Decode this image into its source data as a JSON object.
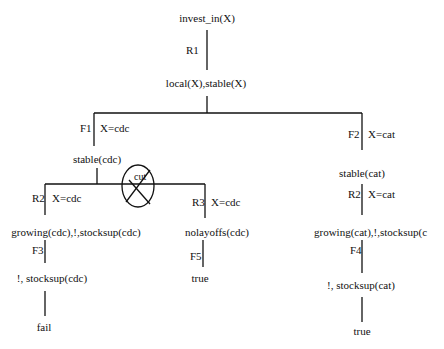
{
  "tree": {
    "root": "invest_in(X)",
    "edges": {
      "r1": {
        "rule": "R1",
        "binding": ""
      },
      "f1": {
        "rule": "F1",
        "binding": "X=cdc"
      },
      "f2": {
        "rule": "F2",
        "binding": "X=cat"
      },
      "r2_left": {
        "rule": "R2",
        "binding": "X=cdc"
      },
      "r3": {
        "rule": "R3",
        "binding": "X=cdc"
      },
      "r2_right": {
        "rule": "R2",
        "binding": "X=cat"
      },
      "f3": {
        "rule": "F3",
        "binding": ""
      },
      "f5": {
        "rule": "F5",
        "binding": ""
      },
      "f4": {
        "rule": "F4",
        "binding": ""
      }
    },
    "nodes": {
      "n1": "local(X),stable(X)",
      "n2_left": "stable(cdc)",
      "n2_right": "stable(cat)",
      "n3_left": "growing(cdc),!,stocksup(cdc)",
      "n3_mid": "nolayoffs(cdc)",
      "n3_right": "growing(cat),!,stocksup(c",
      "n4_left": "!, stocksup(cdc)",
      "n4_mid": "true",
      "n4_right": "!, stocksup(cat)",
      "n5_left": "fail",
      "n5_right": "true"
    },
    "cut_label": "cut"
  }
}
